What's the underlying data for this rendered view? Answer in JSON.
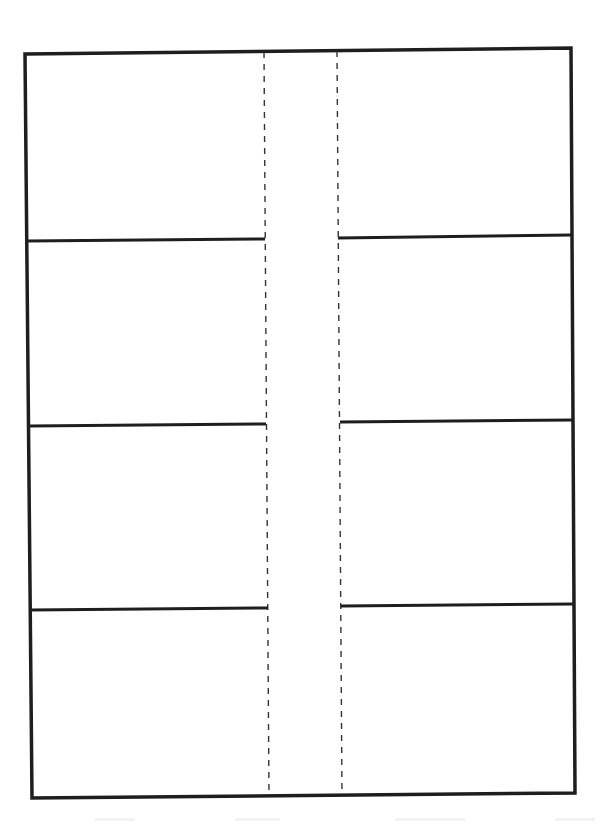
{
  "document": {
    "type": "blank-label-template",
    "layout": {
      "columns": 2,
      "rows": 4,
      "panel_count": 8,
      "center_gutter": "dashed-fold-lines"
    },
    "colors": {
      "line": "#1e1e1e",
      "fold_line": "#333333",
      "background": "#ffffff"
    },
    "frame": {
      "top_left": [
        25,
        54
      ],
      "top_right": [
        571,
        48
      ],
      "bottom_right": [
        575,
        793
      ],
      "bottom_left": [
        32,
        798
      ]
    },
    "fold_lines": [
      {
        "name": "left-fold",
        "x1": 264,
        "y1": 52,
        "x2": 269,
        "y2": 796
      },
      {
        "name": "right-fold",
        "x1": 337,
        "y1": 51,
        "x2": 342,
        "y2": 795
      }
    ],
    "dividers": {
      "left": [
        {
          "x1": 27,
          "y1": 241,
          "x2": 265,
          "y2": 239
        },
        {
          "x1": 30,
          "y1": 426,
          "x2": 266,
          "y2": 424
        },
        {
          "x1": 31,
          "y1": 610,
          "x2": 268,
          "y2": 608
        }
      ],
      "right": [
        {
          "x1": 338,
          "y1": 238,
          "x2": 572,
          "y2": 235
        },
        {
          "x1": 340,
          "y1": 422,
          "x2": 573,
          "y2": 420
        },
        {
          "x1": 341,
          "y1": 606,
          "x2": 574,
          "y2": 604
        }
      ]
    },
    "panels": [
      {
        "id": "panel-1",
        "column": "left",
        "row": 1,
        "content": ""
      },
      {
        "id": "panel-2",
        "column": "right",
        "row": 1,
        "content": ""
      },
      {
        "id": "panel-3",
        "column": "left",
        "row": 2,
        "content": ""
      },
      {
        "id": "panel-4",
        "column": "right",
        "row": 2,
        "content": ""
      },
      {
        "id": "panel-5",
        "column": "left",
        "row": 3,
        "content": ""
      },
      {
        "id": "panel-6",
        "column": "right",
        "row": 3,
        "content": ""
      },
      {
        "id": "panel-7",
        "column": "left",
        "row": 4,
        "content": ""
      },
      {
        "id": "panel-8",
        "column": "right",
        "row": 4,
        "content": ""
      }
    ],
    "footer_text": ""
  }
}
